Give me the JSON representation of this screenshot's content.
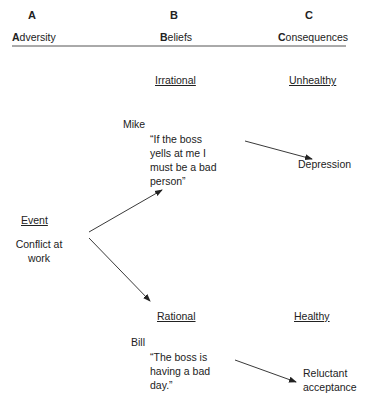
{
  "columns": [
    {
      "letter": "A",
      "initial": "A",
      "rest": "dversity"
    },
    {
      "letter": "B",
      "initial": "B",
      "rest": "eliefs"
    },
    {
      "letter": "C",
      "initial": "C",
      "rest": "onsequences"
    }
  ],
  "adversity": {
    "heading": "Event",
    "text": "Conflict at\nwork"
  },
  "irrational": {
    "heading": "Irrational",
    "person": "Mike",
    "belief": "“If the boss\nyells at me I\nmust be a bad\nperson”",
    "consequence_heading": "Unhealthy",
    "consequence": "Depression"
  },
  "rational": {
    "heading": "Rational",
    "person": "Bill",
    "belief": "“The boss is\nhaving a bad\nday.”",
    "consequence_heading": "Healthy",
    "consequence": "Reluctant\nacceptance"
  }
}
